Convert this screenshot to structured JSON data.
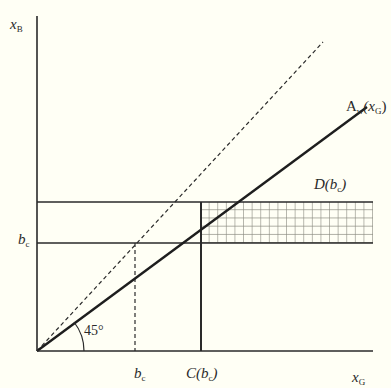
{
  "diagram": {
    "type": "economic-diagram",
    "axes": {
      "x_label": {
        "main": "x",
        "sub": "G"
      },
      "y_label": {
        "main": "x",
        "sub": "B"
      }
    },
    "curves": [
      {
        "name": "45-degree line",
        "style": "dashed"
      },
      {
        "name": "A_w(x_G)",
        "style": "solid-thick"
      }
    ],
    "curve_label": {
      "main": "A",
      "sub": "w",
      "arg_open": "(x",
      "arg_sub": "G",
      "arg_close": ")"
    },
    "region_label": {
      "main": "D(b",
      "sub": "c",
      "close": ")"
    },
    "angle_label": "45°",
    "y_tick_label": {
      "main": "b",
      "sub": "c"
    },
    "x_tick_labels": [
      {
        "main": "b",
        "sub": "c"
      },
      {
        "main": "C(b",
        "sub": "c",
        "close": ")"
      }
    ],
    "colors": {
      "background": "#fffff5",
      "line": "#2a2a2a",
      "hatch": "#8a8a80"
    }
  }
}
